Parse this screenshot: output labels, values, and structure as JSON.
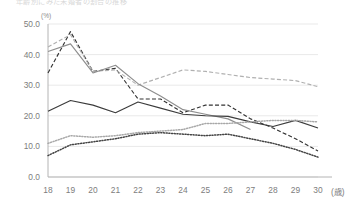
{
  "header": {
    "title": "年齢別にみた未婚者の割合の推移",
    "unit_label": "(%)"
  },
  "axis": {
    "y_ticks": [
      "0.0",
      "10.0",
      "20.0",
      "30.0",
      "40.0",
      "50.0"
    ],
    "x_unit": "(歳)"
  },
  "colors": {
    "grid": "#e9e9e9",
    "axis": "#b4b4b4",
    "tick_text": "#7d7d7d",
    "series_dark_solid": "#3c3c3c",
    "series_gray_solid": "#8e8e8e",
    "series_dark_dashed": "#333333",
    "series_gray_dashed": "#b0b0b0",
    "series_dark_dotted": "#444444",
    "series_gray_dotted": "#a8a8a8"
  },
  "chart_data": {
    "type": "line",
    "title": "年齢別にみた未婚者の割合の推移",
    "xlabel": "(歳)",
    "ylabel": "(%)",
    "xlim": [
      18,
      30
    ],
    "ylim": [
      0.0,
      50.0
    ],
    "ytick_step": 10.0,
    "grid": true,
    "legend": false,
    "x": [
      18,
      19,
      20,
      21,
      22,
      23,
      24,
      25,
      26,
      27,
      28,
      29,
      30
    ],
    "series": [
      {
        "name": "dark-dashed-peak",
        "style": "dashed",
        "color": "#333333",
        "values": [
          34.0,
          47.5,
          34.5,
          35.5,
          25.5,
          25.5,
          21.0,
          23.5,
          23.5,
          19.0,
          16.0,
          12.5,
          8.5
        ]
      },
      {
        "name": "gray-dashed-upper",
        "style": "dashed",
        "color": "#b0b0b0",
        "values": [
          42.5,
          46.5,
          34.5,
          35.0,
          30.0,
          32.5,
          35.0,
          34.5,
          33.5,
          32.5,
          32.0,
          31.5,
          29.5
        ]
      },
      {
        "name": "gray-solid-mid",
        "style": "solid",
        "color": "#8e8e8e",
        "values": [
          41.0,
          43.5,
          34.0,
          36.5,
          30.5,
          26.5,
          22.0,
          20.5,
          19.0,
          15.5,
          null,
          null,
          null
        ]
      },
      {
        "name": "dark-solid-low",
        "style": "solid",
        "color": "#3c3c3c",
        "values": [
          21.5,
          25.0,
          23.5,
          21.0,
          24.5,
          22.5,
          20.5,
          20.0,
          19.8,
          18.0,
          16.5,
          18.5,
          16.0
        ]
      },
      {
        "name": "gray-dotted-bottom",
        "style": "dotted",
        "color": "#a8a8a8",
        "values": [
          11.0,
          13.5,
          13.0,
          13.5,
          14.5,
          15.0,
          15.5,
          17.5,
          17.5,
          18.0,
          18.5,
          18.5,
          18.0
        ]
      },
      {
        "name": "dark-dotted-bottom",
        "style": "dotted",
        "color": "#444444",
        "values": [
          7.0,
          10.5,
          11.5,
          12.5,
          14.0,
          14.5,
          14.0,
          13.5,
          14.0,
          12.5,
          11.0,
          9.0,
          6.5
        ]
      }
    ]
  }
}
